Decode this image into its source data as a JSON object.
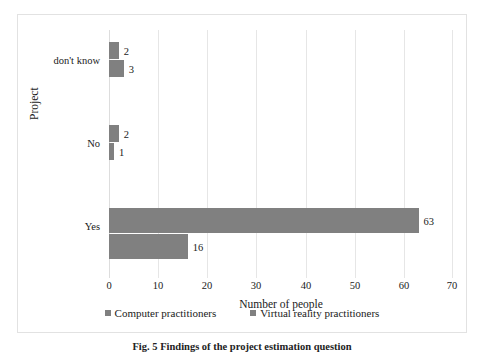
{
  "chart_data": {
    "type": "bar",
    "orientation": "horizontal",
    "grouping": "grouped",
    "title": "",
    "xlabel": "Number of people",
    "ylabel": "Project",
    "xlim": [
      0,
      70
    ],
    "xticks": [
      0,
      10,
      20,
      30,
      40,
      50,
      60,
      70
    ],
    "grid": true,
    "legend_position": "bottom",
    "bar_color": "#808080",
    "gridline_color": "#e6e6e6",
    "categories": [
      "don't know",
      "No",
      "Yes"
    ],
    "series": [
      {
        "name": "Computer practitioners",
        "values": [
          2,
          2,
          63
        ]
      },
      {
        "name": "Virtual reality practitioners",
        "values": [
          3,
          1,
          16
        ]
      }
    ]
  },
  "caption": {
    "text": "Fig. 5   Findings of the project estimation question"
  }
}
